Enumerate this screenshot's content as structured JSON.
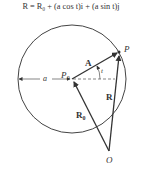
{
  "formula": "R = R₀ + (a cos t)i + (a sin t)j",
  "labels": {
    "P": "P",
    "P0": "P",
    "P0_sub": "0",
    "A": "A",
    "t": "t",
    "a": "a",
    "R": "R",
    "R0": "R",
    "R0_sub": "0",
    "O": "O"
  },
  "colors": {
    "stroke": "#333333",
    "background": "#ffffff"
  }
}
